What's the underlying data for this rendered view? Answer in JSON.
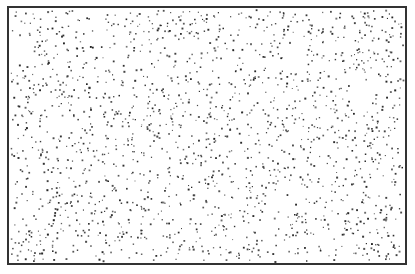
{
  "figure": {
    "frame": {
      "x": 7,
      "y": 6,
      "width": 400,
      "height": 259,
      "border_color": "#333333",
      "border_width": 2
    },
    "background_color": "#ffffff",
    "dots": {
      "count": 1800,
      "color": "#222222",
      "size_min": 1,
      "size_max": 2,
      "seed": 20240611
    }
  }
}
